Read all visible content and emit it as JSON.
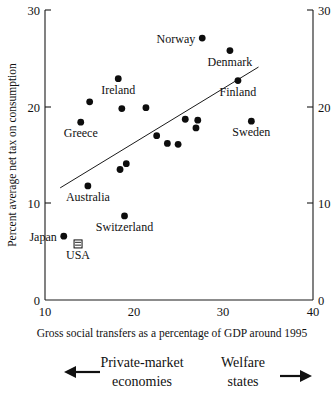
{
  "chart_data": {
    "type": "scatter",
    "title": "",
    "xlabel": "Gross social transfers as a percentage of GDP around 1995",
    "ylabel": "Percent average net tax on consumption",
    "xlim": [
      10,
      40
    ],
    "ylim": [
      0,
      30
    ],
    "xticks": [
      10,
      20,
      30,
      40
    ],
    "yticks": [
      0,
      10,
      20,
      30
    ],
    "right_axis_ticks": [
      0,
      10,
      20,
      30
    ],
    "grid": false,
    "legend": "none",
    "points": [
      {
        "label": "Norway",
        "x": 27.6,
        "y": 27.1,
        "label_pos": "left"
      },
      {
        "label": "Denmark",
        "x": 30.7,
        "y": 25.8,
        "label_pos": "below"
      },
      {
        "label": "Ireland",
        "x": 18.2,
        "y": 22.9,
        "label_pos": "below"
      },
      {
        "label": "Finland",
        "x": 31.6,
        "y": 22.7,
        "label_pos": "below"
      },
      {
        "label": "",
        "x": 15.0,
        "y": 20.5,
        "label_pos": "none"
      },
      {
        "label": "",
        "x": 18.6,
        "y": 19.8,
        "label_pos": "none"
      },
      {
        "label": "",
        "x": 21.3,
        "y": 19.9,
        "label_pos": "none"
      },
      {
        "label": "Greece",
        "x": 14.0,
        "y": 18.4,
        "label_pos": "below"
      },
      {
        "label": "",
        "x": 25.7,
        "y": 18.7,
        "label_pos": "none"
      },
      {
        "label": "",
        "x": 27.1,
        "y": 18.6,
        "label_pos": "none"
      },
      {
        "label": "Sweden",
        "x": 33.1,
        "y": 18.5,
        "label_pos": "below"
      },
      {
        "label": "",
        "x": 26.9,
        "y": 17.8,
        "label_pos": "none"
      },
      {
        "label": "",
        "x": 22.5,
        "y": 17.0,
        "label_pos": "none"
      },
      {
        "label": "",
        "x": 23.7,
        "y": 16.2,
        "label_pos": "none"
      },
      {
        "label": "",
        "x": 24.9,
        "y": 16.1,
        "label_pos": "none"
      },
      {
        "label": "",
        "x": 19.1,
        "y": 14.1,
        "label_pos": "none"
      },
      {
        "label": "",
        "x": 18.4,
        "y": 13.5,
        "label_pos": "none"
      },
      {
        "label": "Australia",
        "x": 14.8,
        "y": 11.8,
        "label_pos": "below"
      },
      {
        "label": "Switzerland",
        "x": 18.9,
        "y": 8.7,
        "label_pos": "below"
      },
      {
        "label": "Japan",
        "x": 12.1,
        "y": 6.6,
        "label_pos": "left"
      },
      {
        "label": "USA",
        "x": 13.7,
        "y": 5.8,
        "label_pos": "below"
      }
    ],
    "trend_line": {
      "x1": 11.7,
      "y1": 11.6,
      "x2": 33.9,
      "y2": 24.1
    },
    "annotations": {
      "left_caption_line1": "Private-market",
      "left_caption_line2": "economies",
      "right_caption_line1": "Welfare",
      "right_caption_line2": "states",
      "left_arrow": "left-arrow-icon",
      "right_arrow": "right-arrow-icon"
    }
  },
  "axis": {
    "x_title": "Gross social transfers as a percentage of GDP around 1995",
    "y_title": "Percent average net tax on consumption",
    "x_tick_labels": [
      "10",
      "20",
      "30",
      "40"
    ],
    "y_tick_labels": [
      "0",
      "10",
      "20",
      "30"
    ],
    "y_tick_labels_right": [
      "0",
      "10",
      "20",
      "30"
    ]
  }
}
